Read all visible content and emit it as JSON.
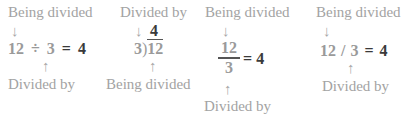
{
  "examples": [
    {
      "notation": "obelus",
      "top_label": "Being divided",
      "bottom_label": "Divided by",
      "dividend": "12",
      "operator": "÷",
      "divisor": "3",
      "equals": "=",
      "quotient": "4"
    },
    {
      "notation": "long-division",
      "top_label": "Divided by",
      "bottom_label": "Being divided",
      "dividend": "12",
      "divisor": "3",
      "bracket": ")",
      "quotient": "4"
    },
    {
      "notation": "fraction",
      "top_label": "Being divided",
      "bottom_label": "Divided by",
      "dividend": "12",
      "divisor": "3",
      "equals": "=",
      "quotient": "4"
    },
    {
      "notation": "slash",
      "top_label": "Being divided",
      "bottom_label": "Divided by",
      "dividend": "12",
      "operator": "/",
      "divisor": "3",
      "equals": "=",
      "quotient": "4"
    }
  ],
  "arrows": {
    "down": "↓",
    "up": "↑"
  },
  "colors": {
    "label": "#a3a3a3",
    "operand": "#9a9a9a",
    "result": "#3a3a3a"
  }
}
